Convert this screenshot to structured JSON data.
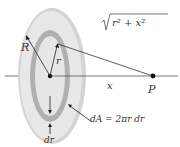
{
  "diagram": {
    "labels": {
      "R": "R",
      "r": "r",
      "sqrt_expr": "r² + x²",
      "x": "x",
      "P": "P",
      "dr": "dr",
      "dA": "dA = 2πr dr"
    },
    "colors": {
      "outer_disk": "#e6e6e6",
      "outer_edge": "#d2d2d2",
      "ring": "#b4b4b4",
      "inner_disk": "#e4e4e4",
      "lines": "#333333"
    }
  }
}
